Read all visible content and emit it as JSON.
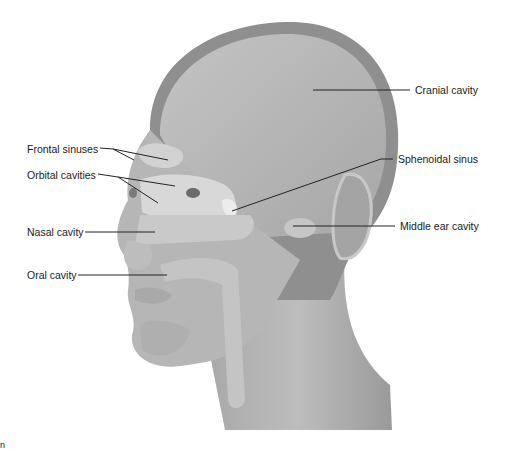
{
  "figure": {
    "colors": {
      "background": "#ffffff",
      "skin": "#b9b9b9",
      "skull_dark": "#8f8f8f",
      "cavity_light": "#d8d8d8",
      "leader_line": "#222222",
      "label_text": "#1a1a1a"
    },
    "labels": [
      {
        "id": "frontal-sinuses",
        "text": "Frontal sinuses",
        "x": 27,
        "y": 143
      },
      {
        "id": "orbital-cavities",
        "text": "Orbital cavities",
        "x": 27,
        "y": 169
      },
      {
        "id": "nasal-cavity",
        "text": "Nasal cavity",
        "x": 27,
        "y": 226
      },
      {
        "id": "oral-cavity",
        "text": "Oral cavity",
        "x": 27,
        "y": 269
      },
      {
        "id": "cranial-cavity",
        "text": "Cranial cavity",
        "x": 415,
        "y": 84
      },
      {
        "id": "sphenoidal-sinus",
        "text": "Sphenoidal sinus",
        "x": 398,
        "y": 153
      },
      {
        "id": "middle-ear-cavity",
        "text": "Middle ear cavity",
        "x": 400,
        "y": 220
      }
    ],
    "corner_glyph": "n"
  }
}
